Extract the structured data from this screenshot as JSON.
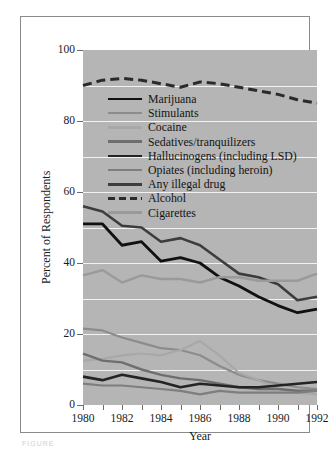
{
  "figure": {
    "caption": "FIGURE"
  },
  "chart_data": {
    "type": "line",
    "title": "",
    "xlabel": "Year",
    "ylabel": "Percent of Respondents",
    "xlim": [
      1980,
      1992
    ],
    "ylim": [
      0,
      100
    ],
    "yticks": [
      0,
      20,
      40,
      60,
      80,
      100
    ],
    "ytick_labels": [
      "0",
      "20",
      "40",
      "60",
      "80",
      "100"
    ],
    "xticks": [
      1980,
      1981,
      1982,
      1983,
      1984,
      1985,
      1986,
      1987,
      1988,
      1989,
      1990,
      1991,
      1992
    ],
    "xtick_labels": [
      "1980",
      "",
      "1982",
      "",
      "1984",
      "",
      "1986",
      "",
      "1988",
      "",
      "1990",
      "",
      "1992"
    ],
    "grid": "horizontal-white-every-10",
    "legend_position": "inside-upper-left",
    "plot_background": "#b5b5b5",
    "x": [
      1980,
      1981,
      1982,
      1983,
      1984,
      1985,
      1986,
      1987,
      1988,
      1989,
      1990,
      1991,
      1992
    ],
    "series": [
      {
        "name": "Marijuana",
        "color": "#111111",
        "width": 2.8,
        "dash": "none",
        "values": [
          51.0,
          51.0,
          45.0,
          46.0,
          40.5,
          41.5,
          40.0,
          36.0,
          33.5,
          30.5,
          28.0,
          26.0,
          27.0
        ]
      },
      {
        "name": "Stimulants",
        "color": "#8c8c8c",
        "width": 2.2,
        "dash": "none",
        "values": [
          21.5,
          21.0,
          19.0,
          17.5,
          16.0,
          15.5,
          14.0,
          11.0,
          8.5,
          7.0,
          6.0,
          5.0,
          4.5
        ]
      },
      {
        "name": "Cocaine",
        "color": "#a8a8a8",
        "width": 2.2,
        "dash": "none",
        "values": [
          12.5,
          13.0,
          14.0,
          14.5,
          14.0,
          15.5,
          18.0,
          14.0,
          9.0,
          7.0,
          4.5,
          3.5,
          3.0
        ]
      },
      {
        "name": "Sedatives/tranquilizers",
        "color": "#6e6e6e",
        "width": 2.4,
        "dash": "none",
        "values": [
          14.5,
          12.5,
          12.0,
          10.0,
          8.5,
          7.5,
          7.0,
          6.0,
          5.0,
          4.5,
          4.5,
          4.0,
          4.0
        ]
      },
      {
        "name": "Hallucinogens (including LSD)",
        "color": "#242424",
        "width": 2.6,
        "dash": "none",
        "values": [
          8.0,
          7.0,
          8.5,
          7.5,
          6.5,
          5.0,
          6.0,
          5.5,
          5.0,
          5.0,
          5.5,
          6.0,
          6.5
        ]
      },
      {
        "name": "Opiates (including heroin)",
        "color": "#7e7e7e",
        "width": 2.2,
        "dash": "none",
        "values": [
          6.0,
          5.5,
          5.5,
          5.0,
          4.5,
          4.0,
          3.0,
          4.0,
          3.5,
          3.5,
          3.5,
          3.5,
          4.0
        ]
      },
      {
        "name": "Any illegal drug",
        "color": "#3d3d3d",
        "width": 2.6,
        "dash": "none",
        "values": [
          56.0,
          54.5,
          50.5,
          50.0,
          46.0,
          47.0,
          45.0,
          41.0,
          37.0,
          36.0,
          34.0,
          29.5,
          30.5
        ]
      },
      {
        "name": "Alcohol",
        "color": "#2a2a2a",
        "width": 3.0,
        "dash": "9 5",
        "values": [
          90.0,
          91.5,
          92.0,
          91.5,
          90.5,
          89.5,
          91.0,
          90.5,
          89.5,
          88.5,
          87.5,
          86.0,
          85.0
        ]
      },
      {
        "name": "Cigarettes",
        "color": "#9a9a9a",
        "width": 2.4,
        "dash": "none",
        "values": [
          36.5,
          38.0,
          34.5,
          36.5,
          35.5,
          35.5,
          34.5,
          36.0,
          36.0,
          35.0,
          35.0,
          35.0,
          37.0
        ]
      }
    ]
  }
}
